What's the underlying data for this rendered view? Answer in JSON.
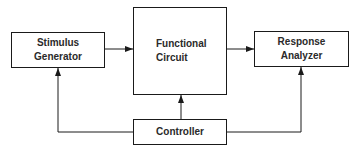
{
  "diagram": {
    "type": "block-diagram",
    "colors": {
      "line": "#1a1a1a",
      "text": "#2a2a2a",
      "background": "#ffffff"
    },
    "blocks": {
      "stimulus": {
        "line1": "Stimulus",
        "line2": "Generator"
      },
      "circuit": {
        "line1": "Functional",
        "line2": "Circuit"
      },
      "response": {
        "line1": "Response",
        "line2": "Analyzer"
      },
      "controller": {
        "line1": "Controller"
      }
    },
    "connections": [
      {
        "from": "Stimulus Generator",
        "to": "Functional Circuit"
      },
      {
        "from": "Functional Circuit",
        "to": "Response Analyzer"
      },
      {
        "from": "Controller",
        "to": "Functional Circuit"
      },
      {
        "from": "Controller",
        "to": "Stimulus Generator"
      },
      {
        "from": "Controller",
        "to": "Response Analyzer"
      }
    ]
  }
}
